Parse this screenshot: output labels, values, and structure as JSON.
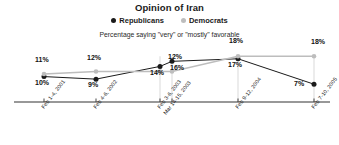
{
  "chart_data": {
    "type": "line",
    "title": "Opinion of Iran",
    "subtitle": "Percentage saying \"very\" or \"mostly\" favorable",
    "xlabel": "",
    "ylabel": "",
    "ylim": [
      0,
      24
    ],
    "grid": false,
    "legend_position": "top-center",
    "categories": [
      "Feb 1-4, 2001",
      "Feb 4-6, 2002",
      "Feb 3-6, 2003",
      "Mar 14-15, 2003",
      "Feb 9-12, 2004",
      "Feb 7-10, 2005"
    ],
    "tick_labels": [
      {
        "line1": "Feb 1-4, 2001",
        "line2": ""
      },
      {
        "line1": "Feb 4-6, 2002",
        "line2": ""
      },
      {
        "line1": "Feb 3-6, 2003",
        "line2": "Mar 14-15, 2003"
      },
      {
        "line1": "",
        "line2": ""
      },
      {
        "line1": "Feb 9-12, 2004",
        "line2": ""
      },
      {
        "line1": "Feb 7-10, 2005",
        "line2": ""
      }
    ],
    "series": [
      {
        "name": "Republicans",
        "color": "#1a1a1a",
        "values": [
          10,
          9,
          14,
          16,
          17,
          7
        ],
        "labels": [
          "10%",
          "9%",
          "14%",
          "16%",
          "17%",
          "7%"
        ]
      },
      {
        "name": "Democrats",
        "color": "#bdbdbd",
        "values": [
          11,
          12,
          12,
          12,
          18,
          18
        ],
        "labels": [
          "11%",
          "12%",
          "12%",
          "12%",
          "18%",
          "18%"
        ]
      }
    ]
  },
  "legend": {
    "items": [
      {
        "label": "Republicans",
        "color": "#1a1a1a"
      },
      {
        "label": "Democrats",
        "color": "#bdbdbd"
      }
    ]
  },
  "colors": {
    "republican": "#1a1a1a",
    "democrat": "#bdbdbd",
    "axis": "#333333",
    "background": "#ffffff"
  }
}
